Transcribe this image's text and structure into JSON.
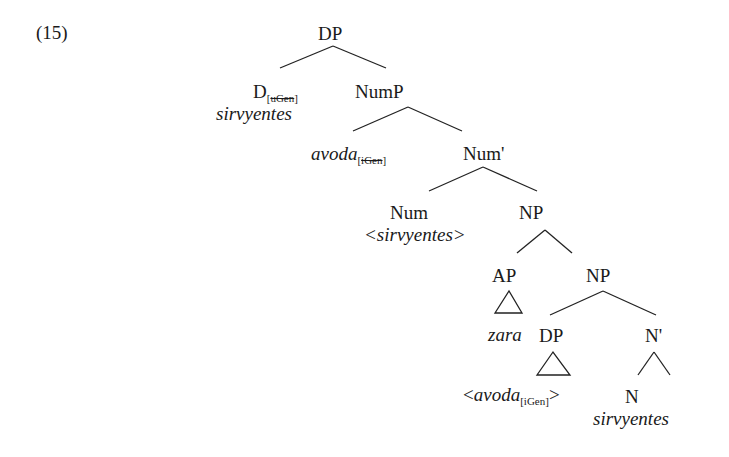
{
  "example_number": "(15)",
  "tree": {
    "dp_root": "DP",
    "d_head": {
      "label": "D",
      "feature": "uGen",
      "feature_struck": true,
      "word": "sirvyentes"
    },
    "nump": "NumP",
    "spec_nump": {
      "word": "avoda",
      "feature": "iGen",
      "feature_struck": true
    },
    "num_bar": "Num'",
    "num": {
      "label": "Num",
      "trace": "<sirvyentes>"
    },
    "np_upper": "NP",
    "ap": {
      "label": "AP",
      "word": "zara"
    },
    "np_lower": "NP",
    "dp_inner": {
      "label": "DP",
      "trace_word": "avoda",
      "feature": "iGen",
      "feature_struck": false
    },
    "n_bar": "N'",
    "n": {
      "label": "N",
      "word": "sirvyentes"
    }
  }
}
